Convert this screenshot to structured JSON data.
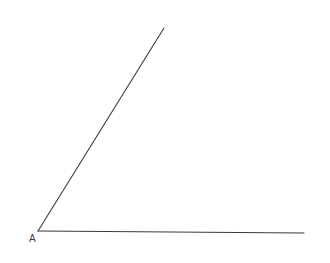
{
  "figure": {
    "kind": "geometry-angle-diagram",
    "canvas": {
      "width": 330,
      "height": 263,
      "background": "#ffffff"
    },
    "stroke": {
      "color": "#3a3a40",
      "width": 1.1
    },
    "vertex": {
      "label": "A",
      "point": {
        "x": 38,
        "y": 231
      },
      "label_position": {
        "x": 29,
        "y": 234
      },
      "label_color": "#3a3a40",
      "label_font_size": 10
    },
    "rays": [
      {
        "name": "upper-ray",
        "from": {
          "x": 38,
          "y": 231
        },
        "to": {
          "x": 164,
          "y": 28
        },
        "direction": "up-right"
      },
      {
        "name": "base-ray",
        "from": {
          "x": 38,
          "y": 231
        },
        "to": {
          "x": 304,
          "y": 233
        },
        "direction": "right"
      }
    ]
  }
}
